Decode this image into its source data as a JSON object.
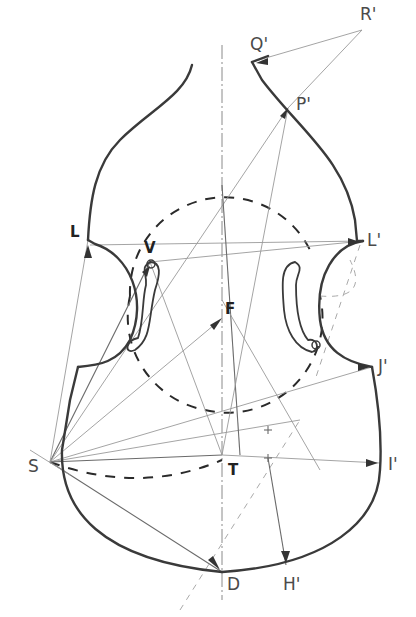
{
  "diagram": {
    "labels": {
      "Q": "Q'",
      "R": "R'",
      "P": "P'",
      "L_left": "L",
      "L_right": "L'",
      "V": "V",
      "F": "F",
      "J": "J'",
      "S": "S",
      "T": "T",
      "I": "I'",
      "D": "D",
      "H": "H'"
    },
    "points": {
      "Q": [
        252,
        62
      ],
      "R": [
        362,
        30
      ],
      "P": [
        288,
        108
      ],
      "L_left": [
        88,
        240
      ],
      "L_right": [
        363,
        241
      ],
      "V": [
        150,
        262
      ],
      "F": [
        220,
        320
      ],
      "J": [
        372,
        367
      ],
      "S": [
        50,
        462
      ],
      "T": [
        222,
        455
      ],
      "I": [
        380,
        463
      ],
      "D": [
        222,
        572
      ],
      "H": [
        286,
        565
      ]
    },
    "colors": {
      "outline": "#3a3a3a",
      "construction": "#9a9a9a",
      "background": "#ffffff"
    }
  }
}
